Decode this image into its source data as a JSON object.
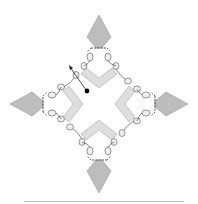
{
  "diagram": {
    "title": "",
    "arms": [
      "top",
      "right",
      "bottom",
      "left"
    ],
    "colors": {
      "kite_fill": "#bdbdbd",
      "chevron_fill": "#dedede",
      "bead_fill": "#efefef",
      "stroke": "#555555",
      "dot": "#000000",
      "baseline": "#bdbdbd"
    },
    "annotations": {
      "arrow": "arrow pointing up-left from a black dot near the upper-left bead",
      "dot": "black dot"
    }
  }
}
